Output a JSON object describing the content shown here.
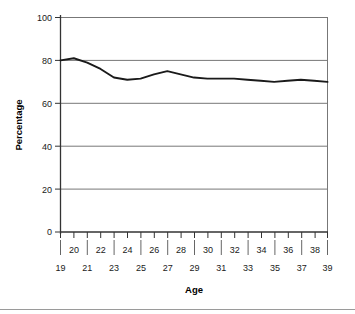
{
  "chart_data": {
    "type": "line",
    "title": "",
    "xlabel": "Age",
    "ylabel": "Percentage",
    "xlim": [
      19,
      39
    ],
    "ylim": [
      0,
      100
    ],
    "grid": true,
    "grid_axis": "y",
    "legend": "none",
    "line_color": "#1a1a1a",
    "x": [
      19,
      20,
      21,
      22,
      23,
      24,
      25,
      26,
      27,
      28,
      29,
      30,
      31,
      32,
      33,
      34,
      35,
      36,
      37,
      38,
      39
    ],
    "values": [
      80,
      81,
      79,
      76,
      72,
      71,
      71.5,
      73.5,
      75,
      73.5,
      72,
      71.5,
      71.5,
      71.5,
      71,
      70.5,
      70,
      70.5,
      71,
      70.5,
      70
    ],
    "series": [
      {
        "name": "Percentage",
        "values": [
          80,
          81,
          79,
          76,
          72,
          71,
          71.5,
          73.5,
          75,
          73.5,
          72,
          71.5,
          71.5,
          71.5,
          71,
          70.5,
          70,
          70.5,
          71,
          70.5,
          70
        ]
      }
    ],
    "y_ticks": [
      0,
      20,
      40,
      60,
      80,
      100
    ],
    "y_tick_labels": [
      "0",
      "20",
      "40",
      "60",
      "80",
      "100"
    ],
    "x_ticks": [
      19,
      20,
      21,
      22,
      23,
      24,
      25,
      26,
      27,
      28,
      29,
      30,
      31,
      32,
      33,
      34,
      35,
      36,
      37,
      38,
      39
    ],
    "x_tick_labels_upper": [
      "",
      "20",
      "",
      "22",
      "",
      "24",
      "",
      "26",
      "",
      "28",
      "",
      "30",
      "",
      "32",
      "",
      "34",
      "",
      "36",
      "",
      "38",
      ""
    ],
    "x_tick_labels_lower": [
      "19",
      "",
      "21",
      "",
      "23",
      "",
      "25",
      "",
      "27",
      "",
      "29",
      "",
      "31",
      "",
      "33",
      "",
      "35",
      "",
      "37",
      "",
      "39"
    ]
  },
  "axes": {
    "y_title": "Percentage",
    "x_title": "Age"
  },
  "y_labels": {
    "t0": "0",
    "t20": "20",
    "t40": "40",
    "t60": "60",
    "t80": "80",
    "t100": "100"
  },
  "x_labels_upper": {
    "a20": "20",
    "a22": "22",
    "a24": "24",
    "a26": "26",
    "a28": "28",
    "a30": "30",
    "a32": "32",
    "a34": "34",
    "a36": "36",
    "a38": "38"
  },
  "x_labels_lower": {
    "a19": "19",
    "a21": "21",
    "a23": "23",
    "a25": "25",
    "a27": "27",
    "a29": "29",
    "a31": "31",
    "a33": "33",
    "a35": "35",
    "a37": "37",
    "a39": "39"
  },
  "colors": {
    "line": "#1a1a1a",
    "grid": "#777777",
    "axis": "#333333",
    "text": "#1a1a1a",
    "background": "#ffffff",
    "rule": "#9a9a9a"
  }
}
